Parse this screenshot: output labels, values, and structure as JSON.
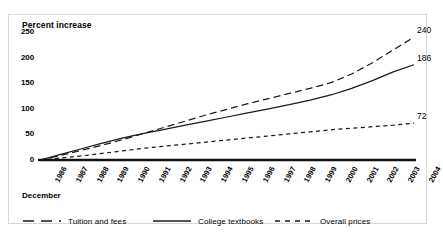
{
  "chart_data": {
    "type": "line",
    "title": "Percent increase",
    "xlabel": "December",
    "ylabel": "",
    "ylim": [
      0,
      250
    ],
    "yticks": [
      0,
      50,
      100,
      150,
      200,
      250
    ],
    "grid": false,
    "legend_position": "bottom",
    "x": [
      1986,
      1987,
      1988,
      1989,
      1990,
      1991,
      1992,
      1993,
      1994,
      1995,
      1996,
      1997,
      1998,
      1999,
      2000,
      2001,
      2002,
      2003,
      2004
    ],
    "categories": [
      "1986",
      "1987",
      "1988",
      "1989",
      "1990",
      "1991",
      "1992",
      "1993",
      "1994",
      "1995",
      "1996",
      "1997",
      "1998",
      "1999",
      "2000",
      "2001",
      "2002",
      "2003",
      "2004"
    ],
    "series": [
      {
        "name": "Tuition and fees",
        "style": "long-dash",
        "color": "#1a1a1a",
        "values": [
          0,
          9,
          19,
          29,
          40,
          52,
          64,
          76,
          88,
          99,
          110,
          120,
          130,
          140,
          151,
          168,
          190,
          215,
          240
        ],
        "end_label": "240"
      },
      {
        "name": "College textbooks",
        "style": "solid",
        "color": "#1a1a1a",
        "values": [
          0,
          11,
          22,
          33,
          43,
          52,
          60,
          68,
          76,
          84,
          92,
          100,
          108,
          117,
          127,
          140,
          155,
          172,
          186
        ],
        "end_label": "186"
      },
      {
        "name": "Overall prices",
        "style": "short-dash",
        "color": "#1a1a1a",
        "values": [
          0,
          4,
          8,
          13,
          18,
          23,
          27,
          31,
          35,
          39,
          43,
          47,
          51,
          55,
          59,
          62,
          65,
          68,
          72
        ],
        "end_label": "72"
      }
    ],
    "annotations": [
      {
        "text": "240",
        "series": "Tuition and fees",
        "at_x": "2004"
      },
      {
        "text": "186",
        "series": "College textbooks",
        "at_x": "2004"
      },
      {
        "text": "72",
        "series": "Overall prices",
        "at_x": "2004"
      }
    ]
  },
  "legend": {
    "items": [
      {
        "label": "Tuition and fees"
      },
      {
        "label": "College textbooks"
      },
      {
        "label": "Overall prices"
      }
    ]
  }
}
